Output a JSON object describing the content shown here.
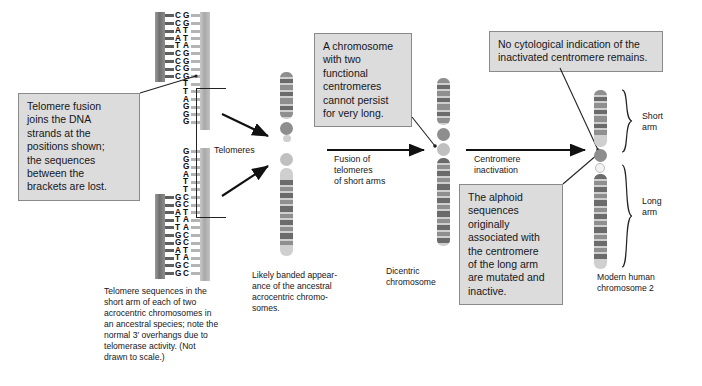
{
  "colors": {
    "callout_fill": "#dcdcdc",
    "callout_border": "#8a8a8a",
    "band_dark": "#6b6b6b",
    "band_mid": "#8f8f8f",
    "band_light": "#c9c9c9",
    "chromatid_bg": "#cfcfcf",
    "centromere_active": "#8e8e8e",
    "centromere_inactive": "#f2f2f2",
    "text": "#16161a",
    "stroke": "#222222"
  },
  "callouts": {
    "telomere_fusion": "Telomere fusion\njoins the DNA\nstrands at the\npositions shown;\nthe sequences\nbetween the\nbrackets are lost.",
    "two_centromeres": "A chromosome\nwith two\nfunctional\ncentromeres\ncannot persist\nfor very long.",
    "no_cytological": "No cytological indication of the\ninactivated centromere remains.",
    "alphoid": "The alphoid\nsequences\noriginally\nassociated with\nthe centromere\nof the long arm\nare mutated and\ninactive."
  },
  "labels": {
    "telomeres": "Telomeres",
    "fusion_of_telomeres": "Fusion of\ntelomeres\nof short arms",
    "centromere_inactivation": "Centromere\ninactivation",
    "short_arm": "Short\narm",
    "long_arm": "Long\narm"
  },
  "captions": {
    "dna_caption": "Telomere sequences in the\nshort arm of each of two\nacrocentric chromosomes in\nan ancestral species; note the\nnormal 3′ overhangs due to\ntelomerase activity. (Not\ndrawn to scale.)",
    "banded_caption": "Likely banded appear-\nance of the ancestral\nacrocentric chromo-\nsomes.",
    "dicentric_caption": "Dicentric\nchromosome",
    "modern_caption": "Modern human\nchromosome 2"
  },
  "dna": {
    "upper_strand": {
      "paired": [
        {
          "left": "C",
          "right": "G"
        },
        {
          "left": "C",
          "right": "G"
        },
        {
          "left": "A",
          "right": "T"
        },
        {
          "left": "A",
          "right": "T"
        },
        {
          "left": "T",
          "right": "A"
        },
        {
          "left": "C",
          "right": "G"
        },
        {
          "left": "C",
          "right": "G"
        },
        {
          "left": "C",
          "right": "G"
        },
        {
          "left": "C",
          "right": "G"
        }
      ],
      "overhang": [
        "T",
        "T",
        "A",
        "G",
        "G",
        "G"
      ],
      "overhang_note": "3′ single-strand overhang"
    },
    "lower_strand": {
      "overhang": [
        "G",
        "G",
        "G",
        "A",
        "T",
        "T"
      ],
      "paired": [
        {
          "left": "G",
          "right": "C"
        },
        {
          "left": "G",
          "right": "C"
        },
        {
          "left": "A",
          "right": "T"
        },
        {
          "left": "T",
          "right": "A"
        },
        {
          "left": "T",
          "right": "A"
        },
        {
          "left": "G",
          "right": "C"
        },
        {
          "left": "G",
          "right": "C"
        },
        {
          "left": "A",
          "right": "T"
        },
        {
          "left": "T",
          "right": "A"
        },
        {
          "left": "G",
          "right": "C"
        },
        {
          "left": "G",
          "right": "C"
        }
      ]
    }
  },
  "chromosomes": {
    "ancestral_upper": {
      "name": "ancestral-acrocentric-upper",
      "bands": [
        {
          "top": 0,
          "height": 5,
          "shade": "band_mid"
        },
        {
          "top": 7,
          "height": 4,
          "shade": "band_dark"
        },
        {
          "top": 13,
          "height": 5,
          "shade": "band_mid"
        },
        {
          "top": 20,
          "height": 4,
          "shade": "band_dark"
        },
        {
          "top": 26,
          "height": 6,
          "shade": "band_mid"
        },
        {
          "top": 34,
          "height": 4,
          "shade": "band_dark"
        },
        {
          "top": 40,
          "height": 5,
          "shade": "band_mid"
        }
      ],
      "centromere": true
    },
    "ancestral_lower": {
      "name": "ancestral-acrocentric-lower",
      "centromere": true,
      "bands": [
        {
          "top": 12,
          "height": 5,
          "shade": "band_dark"
        },
        {
          "top": 19,
          "height": 4,
          "shade": "band_mid"
        },
        {
          "top": 25,
          "height": 5,
          "shade": "band_dark"
        },
        {
          "top": 32,
          "height": 4,
          "shade": "band_mid"
        },
        {
          "top": 38,
          "height": 6,
          "shade": "band_dark"
        },
        {
          "top": 46,
          "height": 4,
          "shade": "band_mid"
        },
        {
          "top": 52,
          "height": 5,
          "shade": "band_dark"
        },
        {
          "top": 59,
          "height": 4,
          "shade": "band_mid"
        },
        {
          "top": 65,
          "height": 6,
          "shade": "band_dark"
        },
        {
          "top": 73,
          "height": 4,
          "shade": "band_mid"
        }
      ]
    },
    "dicentric": {
      "name": "dicentric-chromosome",
      "centromere_count": 2,
      "upper_bands": [
        {
          "top": 0,
          "height": 5,
          "shade": "band_mid"
        },
        {
          "top": 7,
          "height": 4,
          "shade": "band_dark"
        },
        {
          "top": 13,
          "height": 5,
          "shade": "band_mid"
        },
        {
          "top": 20,
          "height": 4,
          "shade": "band_dark"
        },
        {
          "top": 26,
          "height": 6,
          "shade": "band_mid"
        },
        {
          "top": 34,
          "height": 4,
          "shade": "band_dark"
        },
        {
          "top": 40,
          "height": 5,
          "shade": "band_mid"
        }
      ],
      "lower_bands": [
        {
          "top": 0,
          "height": 5,
          "shade": "band_dark"
        },
        {
          "top": 7,
          "height": 4,
          "shade": "band_mid"
        },
        {
          "top": 13,
          "height": 5,
          "shade": "band_dark"
        },
        {
          "top": 20,
          "height": 4,
          "shade": "band_mid"
        },
        {
          "top": 26,
          "height": 6,
          "shade": "band_dark"
        },
        {
          "top": 34,
          "height": 4,
          "shade": "band_mid"
        },
        {
          "top": 40,
          "height": 5,
          "shade": "band_dark"
        },
        {
          "top": 47,
          "height": 4,
          "shade": "band_mid"
        },
        {
          "top": 53,
          "height": 6,
          "shade": "band_dark"
        },
        {
          "top": 61,
          "height": 4,
          "shade": "band_mid"
        },
        {
          "top": 67,
          "height": 5,
          "shade": "band_dark"
        },
        {
          "top": 74,
          "height": 4,
          "shade": "band_mid"
        },
        {
          "top": 80,
          "height": 5,
          "shade": "band_dark"
        }
      ]
    },
    "modern": {
      "name": "modern-human-chromosome-2",
      "short_arm_bands": [
        {
          "top": 0,
          "height": 5,
          "shade": "band_mid"
        },
        {
          "top": 7,
          "height": 4,
          "shade": "band_dark"
        },
        {
          "top": 13,
          "height": 5,
          "shade": "band_mid"
        },
        {
          "top": 20,
          "height": 4,
          "shade": "band_dark"
        },
        {
          "top": 26,
          "height": 6,
          "shade": "band_mid"
        },
        {
          "top": 34,
          "height": 4,
          "shade": "band_dark"
        },
        {
          "top": 40,
          "height": 5,
          "shade": "band_mid"
        }
      ],
      "long_arm_bands": [
        {
          "top": 0,
          "height": 5,
          "shade": "band_dark"
        },
        {
          "top": 7,
          "height": 4,
          "shade": "band_mid"
        },
        {
          "top": 13,
          "height": 5,
          "shade": "band_dark"
        },
        {
          "top": 20,
          "height": 4,
          "shade": "band_mid"
        },
        {
          "top": 26,
          "height": 6,
          "shade": "band_dark"
        },
        {
          "top": 34,
          "height": 4,
          "shade": "band_mid"
        },
        {
          "top": 40,
          "height": 5,
          "shade": "band_dark"
        },
        {
          "top": 47,
          "height": 4,
          "shade": "band_mid"
        },
        {
          "top": 53,
          "height": 6,
          "shade": "band_dark"
        },
        {
          "top": 61,
          "height": 4,
          "shade": "band_mid"
        },
        {
          "top": 67,
          "height": 5,
          "shade": "band_dark"
        },
        {
          "top": 74,
          "height": 4,
          "shade": "band_mid"
        },
        {
          "top": 80,
          "height": 5,
          "shade": "band_dark"
        }
      ]
    }
  }
}
